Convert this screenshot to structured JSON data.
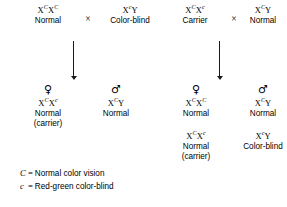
{
  "diagram": {
    "cross_symbol": "×",
    "female_symbol": "♀",
    "male_symbol": "♂",
    "crosses": [
      {
        "id": "cross-left",
        "parents": [
          {
            "id": "left-parent-mother",
            "genotype_base": "X",
            "genotype_parts": [
              {
                "letter": "X",
                "allele": "C"
              },
              {
                "letter": "X",
                "allele": "C"
              }
            ],
            "phenotype": "Normal"
          },
          {
            "id": "left-parent-father",
            "genotype_parts": [
              {
                "letter": "X",
                "allele": "c"
              },
              {
                "letter": "Y",
                "allele": ""
              }
            ],
            "phenotype": "Color-blind"
          }
        ],
        "offspring": [
          {
            "id": "left-offspring-daughter",
            "sex": "female",
            "genotype_parts": [
              {
                "letter": "X",
                "allele": "C"
              },
              {
                "letter": "X",
                "allele": "c"
              }
            ],
            "phenotype": "Normal",
            "note": "(carrier)"
          },
          {
            "id": "left-offspring-son",
            "sex": "male",
            "genotype_parts": [
              {
                "letter": "X",
                "allele": "C"
              },
              {
                "letter": "Y",
                "allele": ""
              }
            ],
            "phenotype": "Normal",
            "note": ""
          }
        ]
      },
      {
        "id": "cross-right",
        "parents": [
          {
            "id": "right-parent-mother",
            "genotype_parts": [
              {
                "letter": "X",
                "allele": "C"
              },
              {
                "letter": "X",
                "allele": "c"
              }
            ],
            "phenotype": "Carrier"
          },
          {
            "id": "right-parent-father",
            "genotype_parts": [
              {
                "letter": "X",
                "allele": "C"
              },
              {
                "letter": "Y",
                "allele": ""
              }
            ],
            "phenotype": "Normal"
          }
        ],
        "offspring": [
          {
            "id": "right-offspring-daughter-1",
            "sex": "female",
            "genotype_parts": [
              {
                "letter": "X",
                "allele": "C"
              },
              {
                "letter": "X",
                "allele": "C"
              }
            ],
            "phenotype": "Normal",
            "note": ""
          },
          {
            "id": "right-offspring-son-1",
            "sex": "male",
            "genotype_parts": [
              {
                "letter": "X",
                "allele": "C"
              },
              {
                "letter": "Y",
                "allele": ""
              }
            ],
            "phenotype": "Normal",
            "note": ""
          },
          {
            "id": "right-offspring-daughter-2",
            "sex": "female",
            "genotype_parts": [
              {
                "letter": "X",
                "allele": "C"
              },
              {
                "letter": "X",
                "allele": "c"
              }
            ],
            "phenotype": "Normal",
            "note": "(carrier)"
          },
          {
            "id": "right-offspring-son-2",
            "sex": "male",
            "genotype_parts": [
              {
                "letter": "X",
                "allele": "c"
              },
              {
                "letter": "Y",
                "allele": ""
              }
            ],
            "phenotype": "Color-blind",
            "note": ""
          }
        ]
      }
    ],
    "legend": [
      {
        "symbol": "C",
        "equals": "=",
        "description": "Normal color vision"
      },
      {
        "symbol": "c",
        "equals": "=",
        "description": "Red-green color-blind"
      }
    ]
  }
}
